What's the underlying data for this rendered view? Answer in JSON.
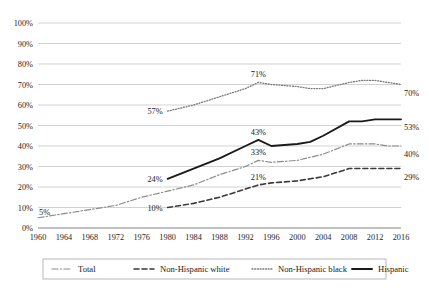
{
  "chart_data": {
    "type": "line",
    "title": "",
    "xlabel": "",
    "ylabel": "",
    "xlim": [
      1960,
      2016
    ],
    "ylim": [
      0,
      100
    ],
    "grid": true,
    "legend_position": "bottom",
    "x": [
      1960,
      1962,
      1964,
      1966,
      1968,
      1970,
      1972,
      1974,
      1976,
      1978,
      1980,
      1982,
      1984,
      1986,
      1988,
      1990,
      1992,
      1994,
      1996,
      1998,
      2000,
      2002,
      2004,
      2006,
      2008,
      2010,
      2012,
      2014,
      2016
    ],
    "xticks": [
      "1960",
      "1964",
      "1968",
      "1972",
      "1976",
      "1980",
      "1984",
      "1988",
      "1992",
      "1996",
      "2000",
      "2004",
      "2008",
      "2012",
      "2016"
    ],
    "yticks": [
      "0%",
      "10%",
      "20%",
      "30%",
      "40%",
      "50%",
      "60%",
      "70%",
      "80%",
      "90%",
      "100%"
    ],
    "series": [
      {
        "name": "Total",
        "style": "dash-dot",
        "color": "#8c8c8c",
        "x": [
          1960,
          1964,
          1968,
          1972,
          1976,
          1980,
          1984,
          1988,
          1992,
          1994,
          1996,
          2000,
          2004,
          2008,
          2010,
          2012,
          2014,
          2016
        ],
        "values": [
          5,
          7,
          9,
          11,
          15,
          18,
          21,
          26,
          30,
          33,
          32,
          33,
          36,
          41,
          41,
          41,
          40,
          40
        ]
      },
      {
        "name": "Non-Hispanic white",
        "style": "dashed",
        "color": "#3a3a3a",
        "x": [
          1980,
          1984,
          1988,
          1992,
          1994,
          1996,
          2000,
          2004,
          2008,
          2010,
          2012,
          2014,
          2016
        ],
        "values": [
          10,
          12,
          15,
          19,
          21,
          22,
          23,
          25,
          29,
          29,
          29,
          29,
          29
        ]
      },
      {
        "name": "Non-Hispanic black",
        "style": "dotted",
        "color": "#7a7a7a",
        "x": [
          1980,
          1984,
          1988,
          1992,
          1994,
          1996,
          2000,
          2002,
          2004,
          2008,
          2010,
          2012,
          2014,
          2016
        ],
        "values": [
          57,
          60,
          64,
          68,
          71,
          70,
          69,
          68,
          68,
          71,
          72,
          72,
          71,
          70
        ]
      },
      {
        "name": "Hispanic",
        "style": "solid",
        "color": "#1a1a1a",
        "x": [
          1980,
          1984,
          1988,
          1992,
          1994,
          1996,
          2000,
          2002,
          2004,
          2008,
          2010,
          2012,
          2014,
          2016
        ],
        "values": [
          24,
          29,
          34,
          40,
          43,
          40,
          41,
          42,
          45,
          52,
          52,
          53,
          53,
          53
        ]
      }
    ],
    "annotations": [
      {
        "text": "5%",
        "x": 1960,
        "y": 5,
        "anchor": "left-above",
        "series": "Total"
      },
      {
        "text": "10%",
        "x": 1980,
        "y": 10,
        "anchor": "left",
        "series": "Non-Hispanic white"
      },
      {
        "text": "21%",
        "x": 1994,
        "y": 21,
        "anchor": "above",
        "series": "Non-Hispanic white"
      },
      {
        "text": "29%",
        "x": 2016,
        "y": 29,
        "anchor": "right-below",
        "series": "Non-Hispanic white"
      },
      {
        "text": "33%",
        "x": 1994,
        "y": 33,
        "anchor": "above",
        "series": "Total"
      },
      {
        "text": "40%",
        "x": 2016,
        "y": 40,
        "anchor": "right-below",
        "series": "Total"
      },
      {
        "text": "24%",
        "x": 1980,
        "y": 24,
        "anchor": "left",
        "series": "Hispanic"
      },
      {
        "text": "43%",
        "x": 1994,
        "y": 43,
        "anchor": "above",
        "series": "Hispanic"
      },
      {
        "text": "53%",
        "x": 2016,
        "y": 53,
        "anchor": "right-below",
        "series": "Hispanic"
      },
      {
        "text": "57%",
        "x": 1980,
        "y": 57,
        "anchor": "left",
        "series": "Non-Hispanic black"
      },
      {
        "text": "71%",
        "x": 1994,
        "y": 71,
        "anchor": "above",
        "series": "Non-Hispanic black"
      },
      {
        "text": "70%",
        "x": 2016,
        "y": 70,
        "anchor": "right-below",
        "series": "Non-Hispanic black"
      }
    ]
  },
  "axis": {
    "y_labels": [
      "100%",
      "90%",
      "80%",
      "70%",
      "60%",
      "50%",
      "40%",
      "30%",
      "20%",
      "10%",
      "0%"
    ],
    "x_labels": [
      "1960",
      "1964",
      "1968",
      "1972",
      "1976",
      "1980",
      "1984",
      "1988",
      "1992",
      "1996",
      "2000",
      "2004",
      "2008",
      "2012",
      "2016"
    ]
  },
  "labels": {
    "total_start": "5%",
    "white_start": "10%",
    "white_mid": "21%",
    "white_end": "29%",
    "total_mid": "33%",
    "total_end": "40%",
    "hispanic_start": "24%",
    "hispanic_peak": "43%",
    "hispanic_end": "53%",
    "black_start": "57%",
    "black_peak": "71%",
    "black_end": "70%"
  },
  "legend": {
    "items": [
      {
        "label": "Total",
        "style": "dash-dot",
        "color": "#8c8c8c"
      },
      {
        "label": "Non-Hispanic white",
        "style": "dashed",
        "color": "#3a3a3a"
      },
      {
        "label": "Non-Hispanic black",
        "style": "dotted",
        "color": "#7a7a7a"
      },
      {
        "label": "Hispanic",
        "style": "solid",
        "color": "#1a1a1a"
      }
    ]
  },
  "colors": {
    "gridline": "#bfbfbf",
    "axis": "#808080",
    "text": "#1a1a1a",
    "background": "#ffffff",
    "legend_border": "#a6a6a6"
  }
}
